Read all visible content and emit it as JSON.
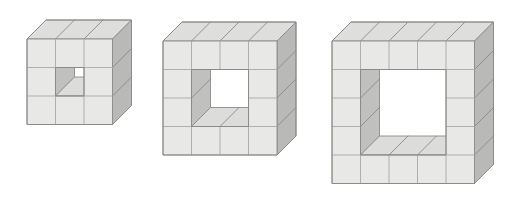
{
  "figure": {
    "type": "geometric-illustration",
    "description": "Three isometric cube-block frames of increasing size, each a square wall of unit cubes one layer deep with a square hole through the centre.",
    "background_color": "#ffffff",
    "canvas": {
      "width": 515,
      "height": 210
    },
    "colors": {
      "front_face": "#e8e8e6",
      "top_face": "#dededc",
      "right_face": "#b9b9b7",
      "inner_left_wall": "#c0c0be",
      "inner_bottom_wall": "#dcdcda",
      "hole": "#ffffff",
      "edge_stroke": "#8a8a88",
      "edge_stroke_light": "#a8a8a6"
    },
    "geometry": {
      "unit_front_px": 28.5,
      "depth_dx_px": 19,
      "depth_dy_px": -19,
      "stroke_width": 0.9
    }
  },
  "shapes": [
    {
      "id": "shape-1",
      "label": "3 by 3 frame with 1 by 1 hole",
      "grid": 3,
      "hole": 1,
      "origin": {
        "x": 27,
        "y": 39
      },
      "cube_count": 24,
      "front_cells": 8,
      "hole_cells": 1
    },
    {
      "id": "shape-2",
      "label": "4 by 4 frame with 2 by 2 hole",
      "grid": 4,
      "hole": 2,
      "origin": {
        "x": 163,
        "y": 41
      },
      "cube_count": 36,
      "front_cells": 12,
      "hole_cells": 4
    },
    {
      "id": "shape-3",
      "label": "5 by 5 frame with 3 by 3 hole",
      "grid": 5,
      "hole": 3,
      "origin": {
        "x": 332,
        "y": 41
      },
      "cube_count": 48,
      "front_cells": 16,
      "hole_cells": 9
    }
  ]
}
